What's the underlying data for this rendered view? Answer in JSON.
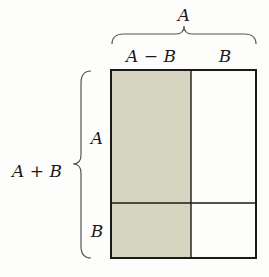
{
  "diagram": {
    "top_brace_label": "A",
    "top_labels": [
      "A − B",
      "B"
    ],
    "left_brace_label": "A + B",
    "left_labels": [
      "A",
      "B"
    ],
    "colors": {
      "shaded": "#d6d5c0",
      "outline": "#1a1a1a",
      "brace": "#555555",
      "background": "#fdfdfb"
    }
  }
}
